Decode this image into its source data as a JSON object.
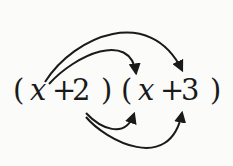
{
  "diagram": {
    "expression": "(x+2)(x+3)",
    "tokens": [
      {
        "text": "(",
        "x": 13,
        "kind": "paren"
      },
      {
        "text": "x",
        "x": 30,
        "kind": "var"
      },
      {
        "text": "+",
        "x": 52,
        "kind": "op"
      },
      {
        "text": "2",
        "x": 72,
        "kind": "num"
      },
      {
        "text": ")",
        "x": 101,
        "kind": "paren"
      },
      {
        "text": "(",
        "x": 121,
        "kind": "paren"
      },
      {
        "text": "x",
        "x": 138,
        "kind": "var"
      },
      {
        "text": "+",
        "x": 160,
        "kind": "op"
      },
      {
        "text": "3",
        "x": 181,
        "kind": "num"
      },
      {
        "text": ")",
        "x": 210,
        "kind": "paren"
      }
    ],
    "arrows": [
      {
        "from": "x",
        "to": "x",
        "position": "top-inner"
      },
      {
        "from": "x",
        "to": "3",
        "position": "top-outer"
      },
      {
        "from": "2",
        "to": "x",
        "position": "bottom-inner"
      },
      {
        "from": "2",
        "to": "3",
        "position": "bottom-outer"
      }
    ],
    "colors": {
      "ink": "#1a1a1a",
      "background": "#fbfbfa"
    }
  }
}
